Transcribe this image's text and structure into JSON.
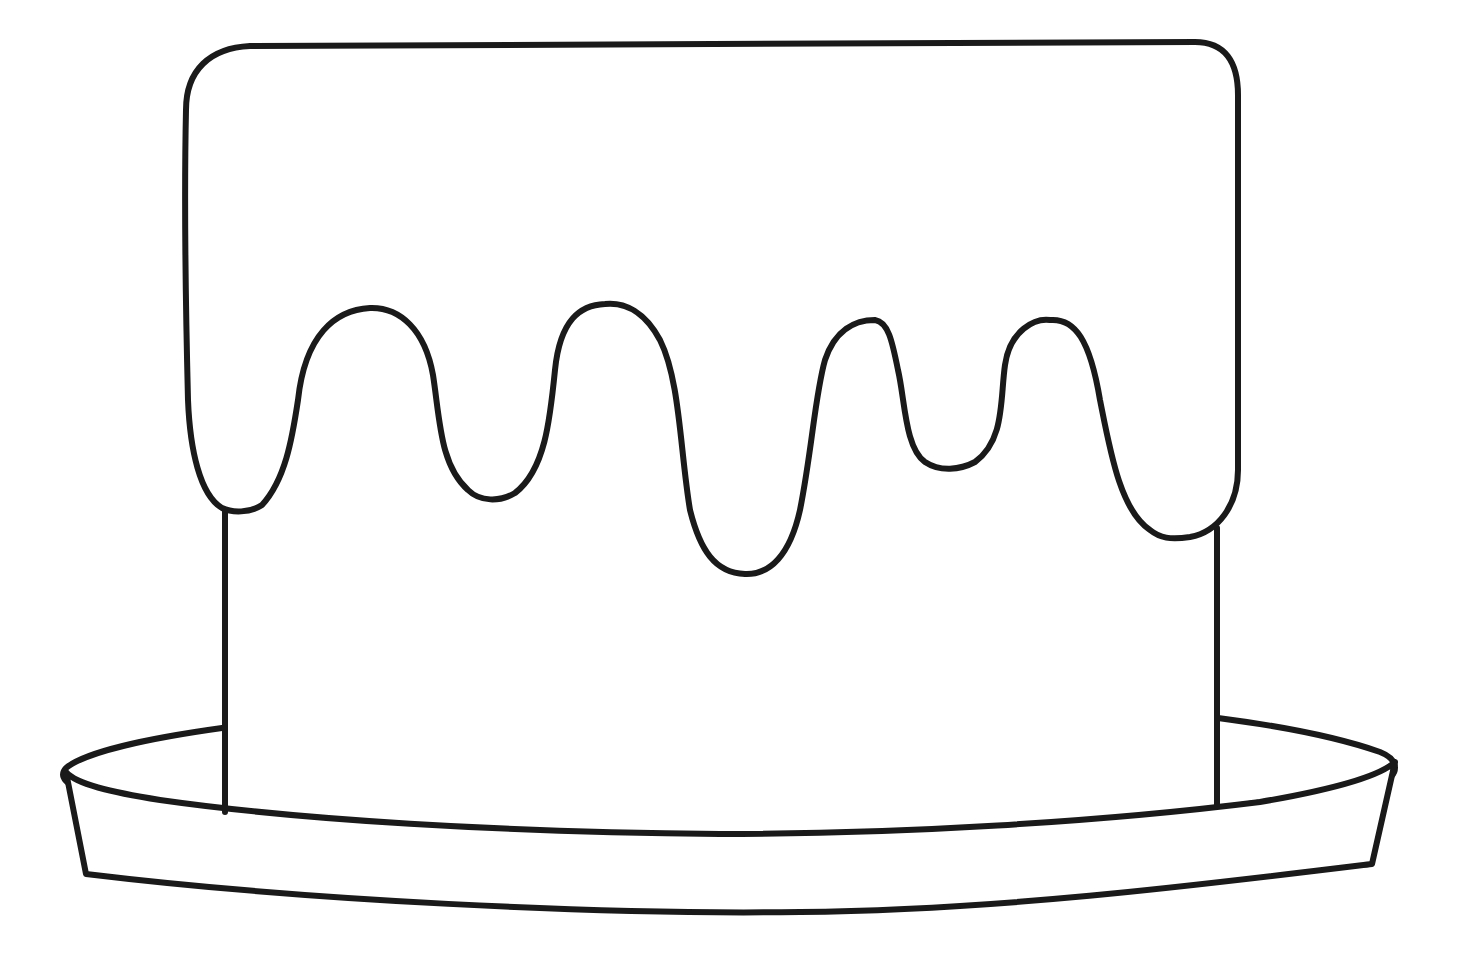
{
  "image": {
    "subject": "cake outline coloring page",
    "background_color": "#ffffff",
    "line_color": "#1a1a1a",
    "parts": [
      {
        "name": "frosting-top",
        "description": "rounded-top frosting layer with dripping edge (5 drips)"
      },
      {
        "name": "cake-body",
        "description": "rectangular cake body below frosting"
      },
      {
        "name": "cake-plate",
        "description": "elliptical serving plate with rim"
      }
    ]
  }
}
